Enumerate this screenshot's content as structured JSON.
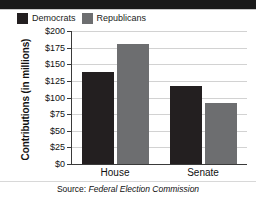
{
  "legend": {
    "items": [
      {
        "label": "Democrats",
        "color": "#231f20",
        "key": "democrats"
      },
      {
        "label": "Republicans",
        "color": "#6d6e70",
        "key": "republicans"
      }
    ]
  },
  "axis": {
    "ytitle": "Contributions (in millions)",
    "yticks": [
      "$200",
      "$175",
      "$150",
      "$125",
      "$100",
      "$75",
      "$50",
      "$25",
      "$0"
    ]
  },
  "caption": {
    "prefix": "Source: ",
    "emphasis": "Federal Election Commission"
  },
  "chart_data": {
    "type": "bar",
    "title": "",
    "xlabel": "",
    "ylabel": "Contributions (in millions)",
    "categories": [
      "House",
      "Senate"
    ],
    "series": [
      {
        "name": "Democrats",
        "color": "#231f20",
        "values": [
          139,
          117
        ]
      },
      {
        "name": "Republicans",
        "color": "#6d6e70",
        "values": [
          180,
          92
        ]
      }
    ],
    "ylim": [
      0,
      200
    ],
    "ytick_values": [
      0,
      25,
      50,
      75,
      100,
      125,
      150,
      175,
      200
    ],
    "ytick_labels": [
      "$0",
      "$25",
      "$50",
      "$75",
      "$100",
      "$125",
      "$150",
      "$175",
      "$200"
    ],
    "grid": true,
    "legend_position": "top-left",
    "source": "Source: Federal Election Commission"
  }
}
